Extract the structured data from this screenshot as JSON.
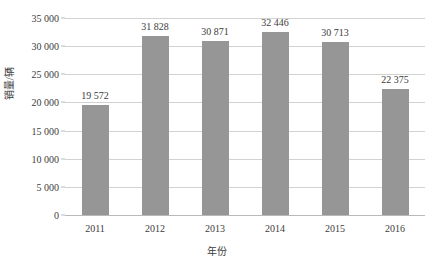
{
  "chart_data": {
    "type": "bar",
    "title": "",
    "subtitle": "",
    "xlabel": "年份",
    "ylabel": "销量/辆",
    "categories": [
      "2011",
      "2012",
      "2013",
      "2014",
      "2015",
      "2016"
    ],
    "values": [
      19572,
      31828,
      30871,
      32446,
      30713,
      22375
    ],
    "value_labels": [
      "19 572",
      "31 828",
      "30 871",
      "32 446",
      "30 713",
      "22 375"
    ],
    "ylim": [
      0,
      35000
    ],
    "ytick_values": [
      0,
      5000,
      10000,
      15000,
      20000,
      25000,
      30000,
      35000
    ],
    "ytick_labels": [
      "0",
      "5 000",
      "10 000",
      "15 000",
      "20 000",
      "25 000",
      "30 000",
      "35 000"
    ],
    "grid": true,
    "legend": false,
    "legend_position": "none",
    "series": [
      {
        "name": "销量",
        "values": [
          19572,
          31828,
          30871,
          32446,
          30713,
          22375
        ],
        "color": "#969696"
      }
    ],
    "colors": {
      "bar": "#969696",
      "gridline": "#d2d2d2",
      "axis": "#b9b9b9",
      "text": "#3c3c3c",
      "background": "#ffffff"
    }
  }
}
